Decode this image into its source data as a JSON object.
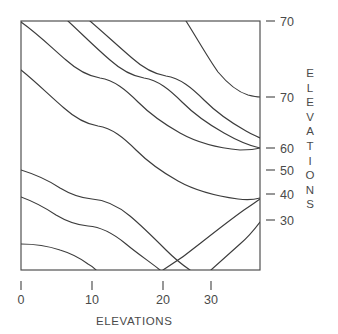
{
  "chart_data": {
    "type": "line",
    "title": "",
    "subtitle": "",
    "xlabel": "ELEVATIONS",
    "ylabel": "ELEVATIONS",
    "grid": false,
    "legend": "none",
    "xlim": [
      0,
      37
    ],
    "ylim": [
      25,
      74
    ],
    "x_ticks": [
      {
        "label": "0",
        "value": 0,
        "px": 21
      },
      {
        "label": "10",
        "value": 10,
        "px": 92
      },
      {
        "label": "20",
        "value": 20,
        "px": 163
      },
      {
        "label": "30",
        "value": 30,
        "px": 211
      }
    ],
    "y_ticks": [
      {
        "label": "70",
        "value": 70,
        "px": 21
      },
      {
        "label": "70",
        "value": 70,
        "px": 97
      },
      {
        "label": "60",
        "value": 60,
        "px": 148
      },
      {
        "label": "50",
        "value": 50,
        "px": 170
      },
      {
        "label": "40",
        "value": 40,
        "px": 194
      },
      {
        "label": "30",
        "value": 30,
        "px": 220
      }
    ],
    "plot_box": {
      "left": 21,
      "top": 21,
      "right": 260,
      "bottom": 270
    },
    "contour_levels": [
      "70",
      "70",
      "60",
      "50",
      "40",
      "30"
    ],
    "series": [
      {
        "name": "contour-1",
        "path": "M 21 22 C 38 34, 52 48, 66 60 C 76 69, 88 76, 100 78 C 114 80, 126 90, 138 102 C 150 114, 164 124, 180 133 C 196 142, 218 148, 240 150 C 248 150, 254 150, 260 148"
      },
      {
        "name": "contour-2",
        "path": "M 21 70 C 36 82, 50 96, 64 108 C 74 117, 86 124, 98 126 C 112 128, 124 138, 136 150 C 148 162, 162 172, 178 181 C 194 190, 216 196, 238 199 C 246 200, 253 200, 260 198"
      },
      {
        "name": "contour-3",
        "path": "M 68 21 C 82 34, 96 48, 110 60 C 120 69, 132 76, 144 78 C 158 80, 170 90, 182 102 C 194 114, 208 124, 224 133 C 238 141, 250 146, 260 148"
      },
      {
        "name": "contour-4",
        "path": "M 90 21 C 104 33, 118 46, 132 58 C 142 67, 154 74, 166 76 C 180 78, 192 88, 204 100 C 216 112, 230 122, 246 131 C 251 134, 256 136, 260 138"
      },
      {
        "name": "contour-5",
        "path": "M 186 21 C 198 40, 208 58, 218 72 C 228 84, 238 92, 248 95 C 252 96, 256 97, 260 97"
      },
      {
        "name": "contour-6",
        "path": "M 21 170 C 34 174, 48 180, 60 188 C 70 194, 80 198, 92 199 C 106 200, 118 206, 130 216 C 142 226, 154 238, 166 250 C 176 260, 184 266, 190 270"
      },
      {
        "name": "contour-7",
        "path": "M 21 197 C 32 201, 44 207, 56 215 C 66 221, 76 225, 88 226 C 102 227, 114 234, 126 244 C 138 254, 150 262, 160 270"
      },
      {
        "name": "contour-8",
        "path": "M 21 244 C 34 244, 48 246, 60 250 C 70 253, 80 258, 88 264 C 92 266, 94 268, 96 270"
      },
      {
        "name": "contour-9",
        "path": "M 163 270 C 176 262, 190 252, 202 242 C 216 231, 230 220, 244 210 C 250 206, 256 202, 260 199"
      },
      {
        "name": "contour-10",
        "path": "M 211 270 C 220 262, 230 253, 240 244 C 247 238, 254 230, 260 222"
      }
    ]
  },
  "axes": {
    "x_axis_title": "ELEVATIONS",
    "y_axis_title": "ELEVATIONS",
    "y_axis_title_letters": [
      "E",
      "L",
      "E",
      "V",
      "A",
      "T",
      "I",
      "O",
      "N",
      "S"
    ]
  },
  "style": {
    "line_color": "#3c3c3c",
    "frame_color": "#4a4a4a",
    "text_color": "#4a4a4a",
    "background": "#ffffff"
  }
}
